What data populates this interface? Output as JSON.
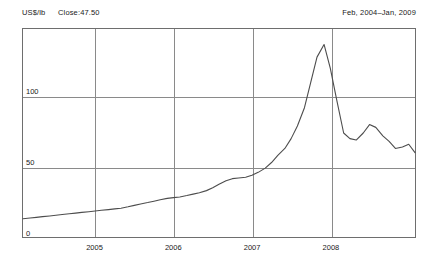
{
  "header": {
    "unit_label": "US$/lb",
    "close_label": "Close:47.50",
    "date_range": "Feb, 2004–Jan, 2009"
  },
  "chart_data": {
    "type": "line",
    "title": "",
    "subtitle": "",
    "xlabel": "",
    "ylabel": "US$/lb",
    "grid": true,
    "legend": null,
    "legend_position": "none",
    "xlim": [
      2004.08,
      2009.08
    ],
    "ylim": [
      0,
      148
    ],
    "yticks": [
      0,
      50,
      100
    ],
    "ytick_labels": [
      "0",
      "50",
      "100"
    ],
    "xticks": [
      2005,
      2006,
      2007,
      2008
    ],
    "xtick_labels": [
      "2005",
      "2006",
      "2007",
      "2008"
    ],
    "line_color": "#4d4d4d",
    "series": [
      {
        "name": "Copper price",
        "x": [
          2004.08,
          2004.17,
          2004.25,
          2004.33,
          2004.42,
          2004.5,
          2004.58,
          2004.67,
          2004.75,
          2004.83,
          2004.92,
          2005.0,
          2005.08,
          2005.17,
          2005.25,
          2005.33,
          2005.42,
          2005.5,
          2005.58,
          2005.67,
          2005.75,
          2005.83,
          2005.92,
          2006.0,
          2006.08,
          2006.17,
          2006.25,
          2006.33,
          2006.42,
          2006.5,
          2006.58,
          2006.67,
          2006.75,
          2006.83,
          2006.92,
          2007.0,
          2007.08,
          2007.17,
          2007.25,
          2007.33,
          2007.42,
          2007.5,
          2007.58,
          2007.67,
          2007.75,
          2007.83,
          2007.92,
          2008.0,
          2008.08,
          2008.17,
          2008.25,
          2008.33,
          2008.42,
          2008.5,
          2008.58,
          2008.67,
          2008.75,
          2008.83,
          2008.92,
          2009.0,
          2009.08
        ],
        "y": [
          13.0,
          13.5,
          14.0,
          14.5,
          15.0,
          15.5,
          16.0,
          16.5,
          17.0,
          17.5,
          18.0,
          18.5,
          19.0,
          19.5,
          20.0,
          20.5,
          21.5,
          22.5,
          23.5,
          24.5,
          25.5,
          26.5,
          27.5,
          28.0,
          28.5,
          29.5,
          30.5,
          31.5,
          33.0,
          35.0,
          37.5,
          40.0,
          41.5,
          42.0,
          42.5,
          44.0,
          46.0,
          49.0,
          53.0,
          58.0,
          63.0,
          70.0,
          79.0,
          92.0,
          110.0,
          128.0,
          137.0,
          120.0,
          98.0,
          74.0,
          70.0,
          69.0,
          74.0,
          80.0,
          78.0,
          72.0,
          68.0,
          63.0,
          64.0,
          66.0,
          60.0
        ]
      }
    ],
    "annotations": [
      {
        "text": "US$/lb",
        "position": "top-left"
      },
      {
        "text": "Close:47.50",
        "position": "top-left"
      },
      {
        "text": "Feb, 2004–Jan, 2009",
        "position": "top-right"
      }
    ]
  }
}
